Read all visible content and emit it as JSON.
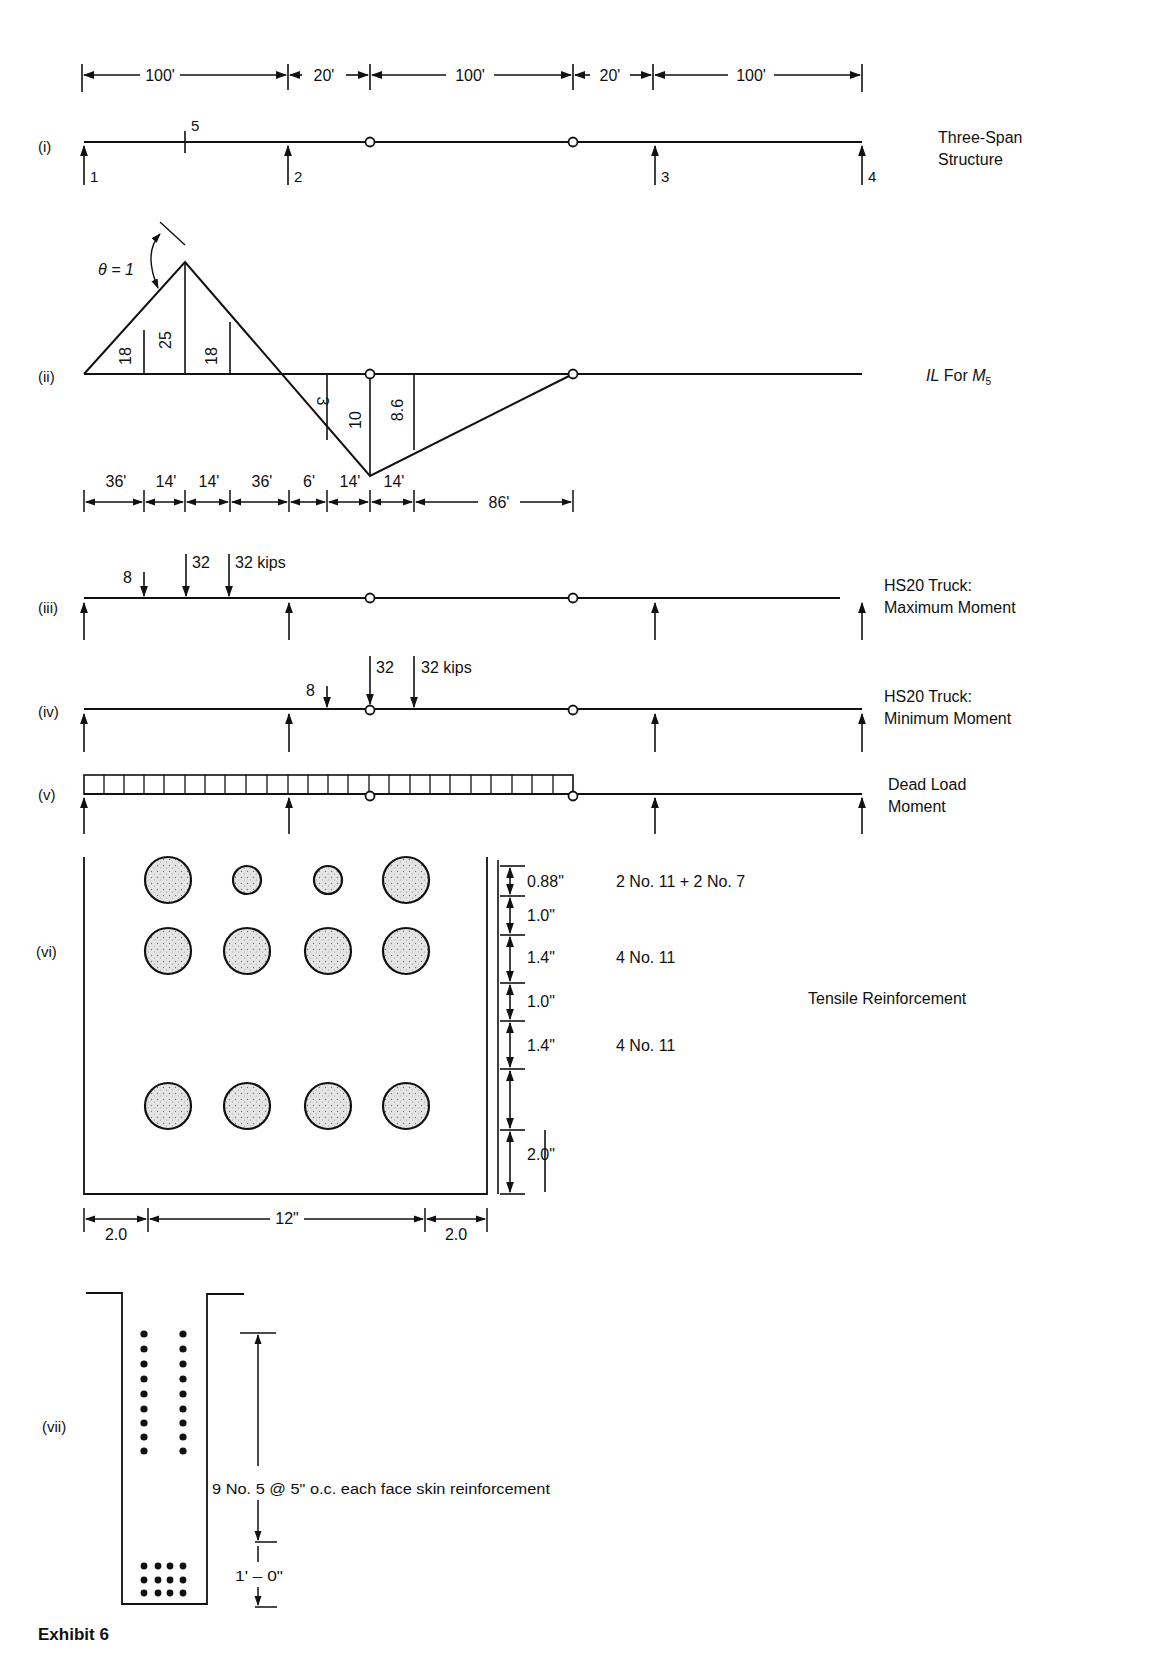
{
  "exhibit_title": "Exhibit 6",
  "panels": {
    "i": {
      "tag": "(i)",
      "title_line1": "Three-Span",
      "title_line2": "Structure",
      "dims": [
        "100'",
        "20'",
        "100'",
        "20'",
        "100'"
      ],
      "point_label": "5",
      "support_labels": [
        "1",
        "2",
        "3",
        "4"
      ]
    },
    "ii": {
      "tag": "(ii)",
      "title_prefix": "IL",
      "title_mid": " For ",
      "title_var": "M",
      "title_sub": "5",
      "theta_label": "θ = 1",
      "positive_ordinates": [
        "18",
        "25",
        "18"
      ],
      "negative_ordinates": [
        "3",
        "10",
        "8.6"
      ],
      "dims": [
        "36'",
        "14'",
        "14'",
        "36'",
        "6'",
        "14'",
        "14'",
        "86'"
      ]
    },
    "iii": {
      "tag": "(iii)",
      "title_line1": "HS20 Truck:",
      "title_line2": "Maximum Moment",
      "loads": [
        "8",
        "32",
        "32 kips"
      ]
    },
    "iv": {
      "tag": "(iv)",
      "title_line1": "HS20 Truck:",
      "title_line2": "Minimum Moment",
      "loads": [
        "8",
        "32",
        "32 kips"
      ]
    },
    "v": {
      "tag": "(v)",
      "title_line1": "Dead Load",
      "title_line2": "Moment"
    },
    "vi": {
      "tag": "(vi)",
      "title": "Tensile Reinforcement",
      "vertical_dims": [
        "0.88\"",
        "1.0\"",
        "1.4\"",
        "1.0\"",
        "1.4\"",
        "2.0\""
      ],
      "layer_labels": [
        "2 No. 11 + 2 No. 7",
        "4 No. 11",
        "4 No. 11"
      ],
      "horizontal_dims": [
        "2.0",
        "12\"",
        "2.0"
      ]
    },
    "vii": {
      "tag": "(vii)",
      "skin_label": "9 No. 5 @ 5\" o.c. each face skin reinforcement",
      "dim_label": "1' – 0\""
    }
  }
}
